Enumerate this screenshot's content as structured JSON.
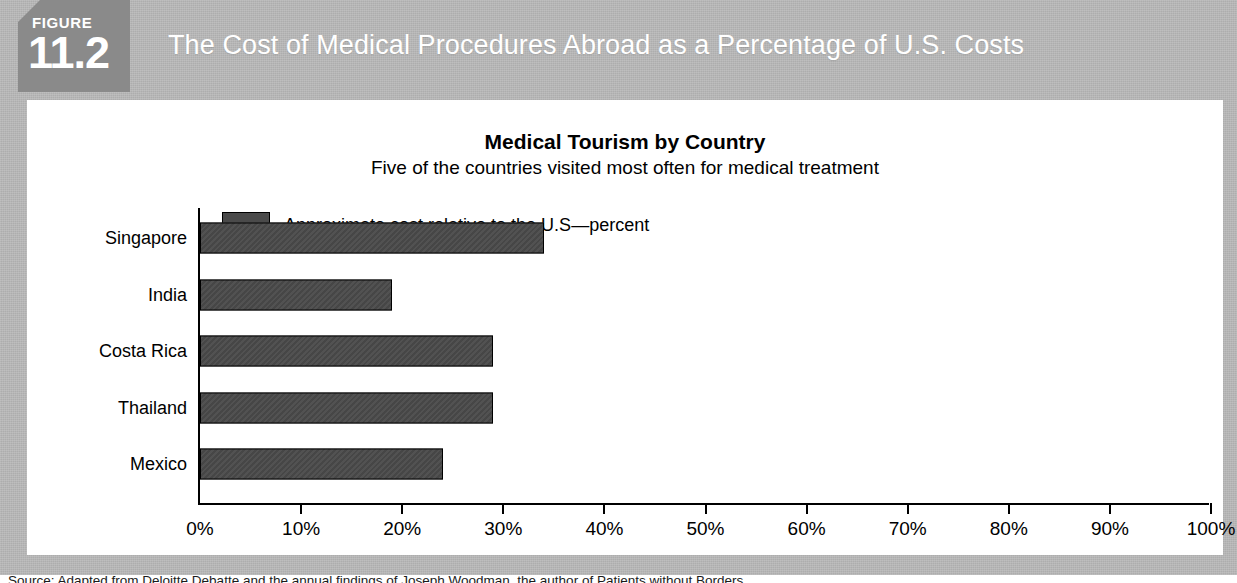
{
  "figure": {
    "badge_word": "FIGURE",
    "badge_number": "11.2",
    "header_title": "The Cost of Medical Procedures Abroad as a Percentage of U.S. Costs",
    "source": "Source: Adapted from Deloitte Debatte and the annual findings of Joseph Woodman, the author of Patients without Borders",
    "colors": {
      "frame_gray": "#b9b9b9",
      "badge_gray": "#8a8a8a",
      "bar_fill": "#4a4a4a",
      "panel_white": "#ffffff",
      "text_black": "#000000"
    }
  },
  "chart_data": {
    "type": "bar",
    "orientation": "horizontal",
    "title": "Medical Tourism by Country",
    "subtitle": "Five of the countries visited most often for medical treatment",
    "legend": [
      "Approximate cost relative to the U.S—percent"
    ],
    "legend_position": "top-left",
    "categories": [
      "Singapore",
      "India",
      "Costa Rica",
      "Thailand",
      "Mexico"
    ],
    "values": [
      34,
      19,
      29,
      29,
      24
    ],
    "xlabel": "",
    "ylabel": "",
    "xlim": [
      0,
      100
    ],
    "xticks": [
      0,
      10,
      20,
      30,
      40,
      50,
      60,
      70,
      80,
      90,
      100
    ],
    "xtick_labels": [
      "0%",
      "10%",
      "20%",
      "30%",
      "40%",
      "50%",
      "60%",
      "70%",
      "80%",
      "90%",
      "100%"
    ],
    "grid": false
  }
}
